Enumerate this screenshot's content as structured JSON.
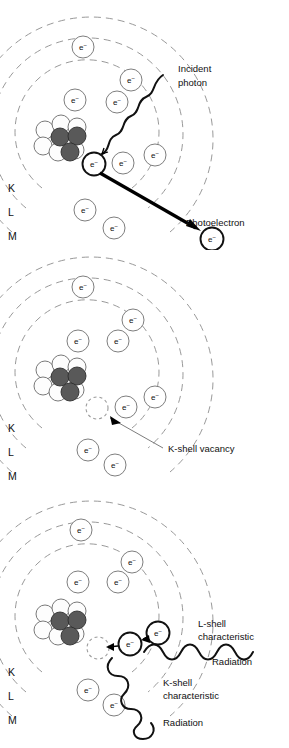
{
  "figure": {
    "electron_symbol": "e",
    "electron_charge": "−",
    "colors": {
      "orbit_stroke": "#8d8d8d",
      "electron_stroke": "#6f6f6f",
      "nucleus_proton": "#595959",
      "nucleus_neutron": "#fdfdfd",
      "wave_stroke": "#111111",
      "arrow": "#000000",
      "background": "#ffffff"
    }
  },
  "shell_labels": {
    "k": "K",
    "l": "L",
    "m": "M"
  },
  "panels": [
    {
      "id": "panel-1",
      "name": "photoelectric-interaction",
      "annotations": [
        {
          "id": "incident-photon",
          "lines": [
            "Incident",
            "photon"
          ]
        },
        {
          "id": "photoelectron",
          "lines": [
            "Photoelectron"
          ]
        }
      ],
      "shells": [
        "K",
        "L",
        "M"
      ],
      "electron_count": 8
    },
    {
      "id": "panel-2",
      "name": "k-shell-vacancy",
      "annotations": [
        {
          "id": "k-shell-vacancy",
          "lines": [
            "K-shell vacancy"
          ]
        }
      ],
      "shells": [
        "K",
        "L",
        "M"
      ],
      "electron_count": 7
    },
    {
      "id": "panel-3",
      "name": "characteristic-radiation",
      "annotations": [
        {
          "id": "l-shell-characteristic",
          "lines": [
            "L-shell",
            "characteristic",
            "Radiation"
          ]
        },
        {
          "id": "k-shell-characteristic",
          "lines": [
            "K-shell",
            "characteristic",
            "Radiation"
          ]
        }
      ],
      "shells": [
        "K",
        "L",
        "M"
      ],
      "electron_count": 8
    }
  ],
  "text": {
    "incident_photon_l1": "Incident",
    "incident_photon_l2": "photon",
    "photoelectron": "Photoelectron",
    "k_shell_vacancy": "K-shell vacancy",
    "l_shell_l1": "L-shell",
    "l_shell_l2": "characteristic",
    "l_shell_l3": "Radiation",
    "k_shell_l1": "K-shell",
    "k_shell_l2": "characteristic",
    "k_shell_l3": "Radiation"
  }
}
